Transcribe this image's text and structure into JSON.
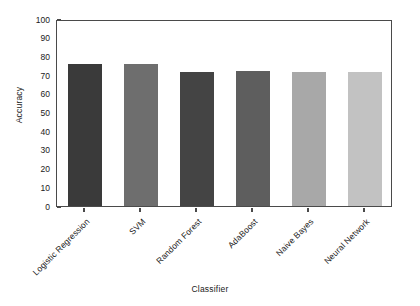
{
  "chart_data": {
    "type": "bar",
    "title": "",
    "xlabel": "Classifier",
    "ylabel": "Accuracy",
    "categories": [
      "Logistic Regression",
      "SVM",
      "Random Forest",
      "AdaBoost",
      "Naive Bayes",
      "Neural Network"
    ],
    "values": [
      76,
      76,
      71.5,
      72,
      71.5,
      71.5
    ],
    "colors": [
      "#3a3a3a",
      "#6e6e6e",
      "#444444",
      "#5e5e5e",
      "#a8a8a8",
      "#c2c2c2"
    ],
    "ylim": [
      0,
      100
    ],
    "yticks": [
      0,
      10,
      20,
      30,
      40,
      50,
      60,
      70,
      80,
      90,
      100
    ],
    "ytick_labels": [
      "0",
      "10",
      "20",
      "30",
      "40",
      "50",
      "60",
      "70",
      "80",
      "90",
      "100"
    ],
    "grid": false,
    "legend": null,
    "axis_color": "#4a4a4a",
    "text_color": "#1a1a1a",
    "background": "#ffffff",
    "xtick_rotation_deg": -45
  }
}
